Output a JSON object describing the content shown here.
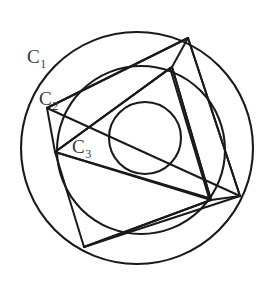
{
  "figure": {
    "background_color": "#ffffff",
    "stroke_color": "#1a1a1a",
    "label_color": "#3a3a3a",
    "width": 269,
    "height": 282
  },
  "labels": {
    "c1": {
      "base": "C",
      "sub": "1",
      "x": 27,
      "y": 47
    },
    "c2": {
      "base": "C",
      "sub": "2",
      "x": 39,
      "y": 89
    },
    "c3": {
      "base": "C",
      "sub": "3",
      "x": 72,
      "y": 137
    }
  },
  "geometry": {
    "circles": [
      {
        "name": "C1",
        "cx": 137,
        "cy": 148,
        "r": 116,
        "role": "outer-circle"
      },
      {
        "name": "C2",
        "cx": 141,
        "cy": 150,
        "r": 84,
        "role": "middle-circle"
      },
      {
        "name": "C3",
        "cx": 145,
        "cy": 138,
        "r": 36,
        "role": "inner-circle"
      }
    ],
    "polygons": [
      {
        "name": "outer-triangle",
        "role": "triangle-inscribed-in-C1",
        "points": "47,108 188,38 240,196"
      },
      {
        "name": "outer-quad-chord",
        "role": "chord-path-on-C1",
        "points": "47,108 188,38 240,196 84,247"
      },
      {
        "name": "middle-triangle",
        "role": "triangle-inscribed-in-C2",
        "points": "55,152 172,67 211,200"
      },
      {
        "name": "middle-quad-chord",
        "role": "chord-path-on-C2",
        "points": "55,152 172,67 211,200 84,247"
      },
      {
        "name": "inner-triangle",
        "role": "triangle-circumscribing-C3",
        "points": "55,152 170,68 209,198"
      }
    ],
    "segments": [
      {
        "name": "spoke-top",
        "x1": 188,
        "y1": 38,
        "x2": 172,
        "y2": 67
      },
      {
        "name": "spoke-right-upper",
        "x1": 172,
        "y1": 67,
        "x2": 211,
        "y2": 200
      },
      {
        "name": "spoke-right-lower",
        "x1": 240,
        "y1": 196,
        "x2": 211,
        "y2": 200
      },
      {
        "name": "spoke-left",
        "x1": 47,
        "y1": 108,
        "x2": 55,
        "y2": 152
      },
      {
        "name": "spoke-bottom-left",
        "x1": 55,
        "y1": 152,
        "x2": 84,
        "y2": 247
      },
      {
        "name": "spoke-bottom",
        "x1": 84,
        "y1": 247,
        "x2": 211,
        "y2": 200
      }
    ]
  }
}
